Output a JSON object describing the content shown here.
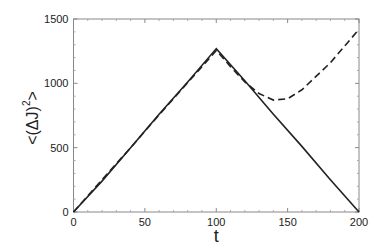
{
  "chart_data": {
    "type": "line",
    "title": "",
    "xlabel": "t",
    "ylabel": "<(ΔJ)²>",
    "xlim": [
      0,
      200
    ],
    "ylim": [
      0,
      1500
    ],
    "xticks": [
      0,
      50,
      100,
      150,
      200
    ],
    "yticks": [
      0,
      500,
      1000,
      1500
    ],
    "grid": false,
    "legend": null,
    "series": [
      {
        "name": "solid",
        "style": "solid",
        "x": [
          0,
          20,
          40,
          60,
          80,
          100,
          120,
          140,
          160,
          180,
          200
        ],
        "y": [
          0,
          240,
          500,
          760,
          1010,
          1270,
          1020,
          760,
          510,
          250,
          0
        ]
      },
      {
        "name": "dashed",
        "style": "dashed",
        "x": [
          0,
          20,
          40,
          60,
          80,
          100,
          110,
          120,
          130,
          140,
          150,
          160,
          180,
          200
        ],
        "y": [
          0,
          250,
          500,
          755,
          1005,
          1255,
          1130,
          1010,
          920,
          870,
          880,
          950,
          1160,
          1420
        ]
      }
    ]
  },
  "labels": {
    "xlabel": "t",
    "ylabel_main": "<(ΔJ)",
    "ylabel_sup": "2",
    "ylabel_end": ">"
  }
}
